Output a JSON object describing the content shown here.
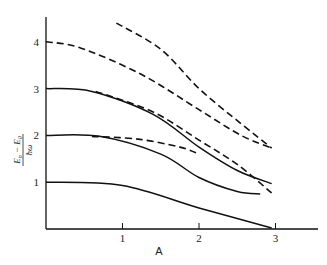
{
  "chart_data": {
    "type": "line",
    "title": "",
    "xlabel": "A",
    "ylabel": "(E_n − E_0) / ħω",
    "ylabel_parts": {
      "num_left": "E",
      "num_left_sub": "n",
      "minus": "−",
      "num_right": "E",
      "num_right_sub": "0",
      "den": "ħω"
    },
    "xlim": [
      0,
      3.4
    ],
    "ylim": [
      0,
      4.6
    ],
    "x_ticks": [
      "1",
      "2",
      "3"
    ],
    "y_ticks": [
      "1",
      "2",
      "3",
      "4"
    ],
    "grid": false,
    "legend": null,
    "series": [
      {
        "name": "solid-level-1",
        "style": "solid",
        "points": [
          [
            0,
            1.0
          ],
          [
            1,
            0.93
          ],
          [
            2,
            0.45
          ],
          [
            2.95,
            0.02
          ]
        ]
      },
      {
        "name": "solid-level-2",
        "style": "solid",
        "points": [
          [
            0,
            2.0
          ],
          [
            0.7,
            1.98
          ],
          [
            1.5,
            1.6
          ],
          [
            2,
            1.1
          ],
          [
            2.5,
            0.8
          ],
          [
            2.8,
            0.75
          ]
        ]
      },
      {
        "name": "solid-level-3",
        "style": "solid",
        "points": [
          [
            0,
            3.0
          ],
          [
            0.6,
            2.94
          ],
          [
            1.4,
            2.45
          ],
          [
            2,
            1.75
          ],
          [
            2.5,
            1.25
          ],
          [
            2.95,
            0.97
          ]
        ]
      },
      {
        "name": "dashed-from-3",
        "style": "dashed",
        "points": [
          [
            0.65,
            2.94
          ],
          [
            1.4,
            2.5
          ],
          [
            2,
            1.9
          ],
          [
            2.5,
            1.38
          ],
          [
            2.95,
            0.77
          ]
        ]
      },
      {
        "name": "dashed-from-2",
        "style": "dashed",
        "points": [
          [
            0.6,
            1.98
          ],
          [
            1.2,
            1.92
          ],
          [
            1.75,
            1.75
          ],
          [
            2,
            1.6
          ]
        ]
      },
      {
        "name": "dashed-level-4",
        "style": "dashed",
        "points": [
          [
            0,
            4.0
          ],
          [
            0.45,
            3.87
          ],
          [
            1.25,
            3.3
          ],
          [
            2,
            2.55
          ],
          [
            2.55,
            2.0
          ],
          [
            2.95,
            1.73
          ]
        ]
      },
      {
        "name": "dashed-top",
        "style": "dashed",
        "points": [
          [
            0.92,
            4.4
          ],
          [
            1.5,
            3.84
          ],
          [
            2,
            3.0
          ],
          [
            2.55,
            2.25
          ],
          [
            2.95,
            1.73
          ]
        ]
      }
    ]
  }
}
